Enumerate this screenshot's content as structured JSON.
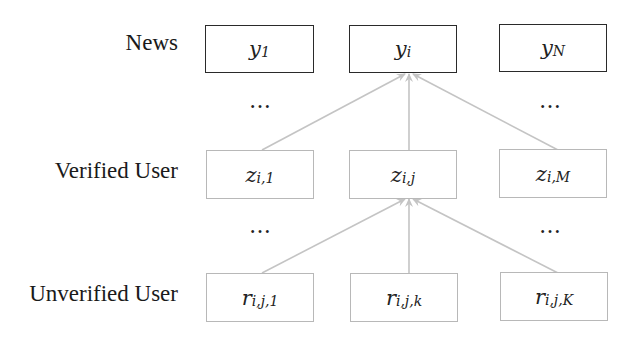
{
  "diagram": {
    "rows": [
      {
        "label": "News",
        "nodes": [
          {
            "base": "y",
            "sub": "1"
          },
          {
            "base": "y",
            "sub": "i"
          },
          {
            "base": "y",
            "sub": "N"
          }
        ]
      },
      {
        "label": "Verified User",
        "nodes": [
          {
            "base": "z",
            "sub": "i,1"
          },
          {
            "base": "z",
            "sub": "i,j"
          },
          {
            "base": "z",
            "sub": "i,M"
          }
        ]
      },
      {
        "label": "Unverified User",
        "nodes": [
          {
            "base": "r",
            "sub": "i,j,1"
          },
          {
            "base": "r",
            "sub": "i,j,k"
          },
          {
            "base": "r",
            "sub": "i,j,K"
          }
        ]
      }
    ],
    "ellipsis": "…",
    "edges": [
      {
        "from": "z_{i,1}",
        "to": "y_i"
      },
      {
        "from": "z_{i,j}",
        "to": "y_i"
      },
      {
        "from": "z_{i,M}",
        "to": "y_i"
      },
      {
        "from": "r_{i,j,1}",
        "to": "z_{i,j}"
      },
      {
        "from": "r_{i,j,k}",
        "to": "z_{i,j}"
      },
      {
        "from": "r_{i,j,K}",
        "to": "z_{i,j}"
      }
    ],
    "colors": {
      "news_border": "#2a2a2a",
      "user_border": "#b8b8b8",
      "edge": "#c4c4c4"
    }
  }
}
